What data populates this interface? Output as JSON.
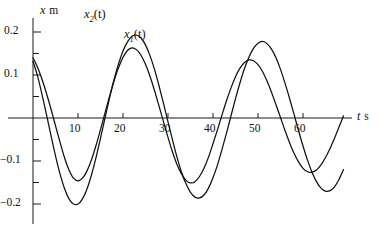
{
  "chart_data": {
    "type": "line",
    "title": "",
    "xlabel": "t s",
    "ylabel": "x m",
    "x_axis_symbol": "t",
    "x_axis_unit": "s",
    "y_axis_symbol": "x",
    "y_axis_unit": "m",
    "xlim": [
      0,
      70
    ],
    "ylim": [
      -0.22,
      0.22
    ],
    "x_ticks": [
      10,
      20,
      30,
      40,
      50,
      60
    ],
    "x_tick_labels": [
      "10",
      "20",
      "30",
      "40",
      "50",
      "60"
    ],
    "y_ticks": [
      -0.2,
      -0.1,
      0.1,
      0.2
    ],
    "y_tick_labels": [
      "-0.2",
      "-0.1",
      "0.1",
      "0.2"
    ],
    "y_minor_ticks": [
      -0.15,
      -0.05,
      0.05,
      0.15
    ],
    "grid": false,
    "legend": "inline-annotations",
    "annotations": [
      {
        "text": "x2(t)",
        "label_symbol": "x",
        "label_sub": "2",
        "label_suffix": "(t)",
        "x": 15,
        "y": 0.215
      },
      {
        "text": "x1(t)",
        "label_symbol": "x",
        "label_sub": "1",
        "label_suffix": "(t)",
        "x": 23,
        "y": 0.18
      }
    ],
    "series": [
      {
        "name": "x2(t)",
        "description": "damped oscillation, larger amplitude, shorter period",
        "amplitude0": 0.205,
        "period": 15.0,
        "damping_tau": 150,
        "phase_deg": 40,
        "points_x": [
          0,
          1,
          2,
          3,
          4,
          5,
          6,
          7,
          8,
          9,
          10,
          11,
          12,
          13,
          14,
          15,
          16,
          17,
          18,
          19,
          20,
          21,
          22,
          23,
          24,
          25,
          26,
          27,
          28,
          29,
          30,
          31,
          32,
          33,
          34,
          35,
          36,
          37,
          38,
          39,
          40,
          41,
          42,
          43,
          44,
          45,
          46,
          47,
          48,
          49,
          50,
          51,
          52,
          53,
          54,
          55,
          56,
          57,
          58,
          59,
          60,
          61,
          62,
          63,
          64,
          65,
          66,
          67,
          68,
          69
        ],
        "points_y": [
          0.132,
          0.098,
          0.055,
          0.008,
          -0.041,
          -0.088,
          -0.13,
          -0.164,
          -0.188,
          -0.2,
          -0.2,
          -0.188,
          -0.165,
          -0.132,
          -0.092,
          -0.047,
          0.0,
          0.046,
          0.089,
          0.126,
          0.156,
          0.177,
          0.19,
          0.193,
          0.186,
          0.17,
          0.145,
          0.113,
          0.075,
          0.034,
          -0.009,
          -0.051,
          -0.091,
          -0.126,
          -0.153,
          -0.173,
          -0.184,
          -0.186,
          -0.179,
          -0.163,
          -0.139,
          -0.109,
          -0.073,
          -0.035,
          0.005,
          0.045,
          0.082,
          0.115,
          0.142,
          0.162,
          0.174,
          0.178,
          0.173,
          0.16,
          0.14,
          0.113,
          0.081,
          0.046,
          0.009,
          -0.029,
          -0.065,
          -0.098,
          -0.126,
          -0.148,
          -0.163,
          -0.17,
          -0.169,
          -0.16,
          -0.143,
          -0.12
        ]
      },
      {
        "name": "x1(t)",
        "description": "damped oscillation, slightly longer period, lags x2",
        "amplitude0": 0.2,
        "period": 17.0,
        "damping_tau": 160,
        "phase_deg": 48,
        "points_x": [
          0,
          1,
          2,
          3,
          4,
          5,
          6,
          7,
          8,
          9,
          10,
          11,
          12,
          13,
          14,
          15,
          16,
          17,
          18,
          19,
          20,
          21,
          22,
          23,
          24,
          25,
          26,
          27,
          28,
          29,
          30,
          31,
          32,
          33,
          34,
          35,
          36,
          37,
          38,
          39,
          40,
          41,
          42,
          43,
          44,
          45,
          46,
          47,
          48,
          49,
          50,
          51,
          52,
          53,
          54,
          55,
          56,
          57,
          58,
          59,
          60,
          61,
          62,
          63,
          64,
          65,
          66,
          67,
          68,
          69
        ],
        "points_y": [
          0.14,
          0.118,
          0.09,
          0.057,
          0.021,
          -0.018,
          -0.056,
          -0.092,
          -0.121,
          -0.14,
          -0.146,
          -0.14,
          -0.123,
          -0.097,
          -0.064,
          -0.027,
          0.012,
          0.05,
          0.086,
          0.117,
          0.141,
          0.157,
          0.163,
          0.159,
          0.146,
          0.125,
          0.097,
          0.064,
          0.028,
          -0.009,
          -0.045,
          -0.079,
          -0.108,
          -0.13,
          -0.145,
          -0.151,
          -0.148,
          -0.136,
          -0.117,
          -0.091,
          -0.06,
          -0.027,
          0.007,
          0.04,
          0.07,
          0.096,
          0.116,
          0.129,
          0.135,
          0.133,
          0.124,
          0.108,
          0.086,
          0.06,
          0.031,
          0.001,
          -0.029,
          -0.057,
          -0.082,
          -0.102,
          -0.117,
          -0.125,
          -0.126,
          -0.121,
          -0.109,
          -0.092,
          -0.071,
          -0.047,
          -0.021,
          0.005
        ]
      }
    ]
  },
  "axes": {
    "y_label_symbol": "x",
    "y_label_unit": "m",
    "x_label_symbol": "t",
    "x_label_unit": "s"
  },
  "colors": {
    "curve": "#111111",
    "axis": "#1a1a1a",
    "background": "#ffffff"
  }
}
